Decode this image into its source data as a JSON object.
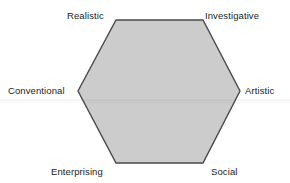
{
  "figure": {
    "shape": "hexagon",
    "background_color": "#ffffff",
    "fill_color": "#cccccc",
    "stroke_color": "#4a4a4a",
    "text_color": "#1b1b1b"
  },
  "chart_data": {
    "type": "diagram",
    "title": "",
    "shape": "hexagon",
    "vertices": [
      {
        "id": "realistic",
        "label": "Realistic",
        "position": "top-left",
        "x": 116,
        "y": 20
      },
      {
        "id": "investigative",
        "label": "Investigative",
        "position": "top-right",
        "x": 203,
        "y": 20
      },
      {
        "id": "artistic",
        "label": "Artistic",
        "position": "right",
        "x": 240,
        "y": 91
      },
      {
        "id": "social",
        "label": "Social",
        "position": "bottom-right",
        "x": 203,
        "y": 163
      },
      {
        "id": "enterprising",
        "label": "Enterprising",
        "position": "bottom-left",
        "x": 116,
        "y": 163
      },
      {
        "id": "conventional",
        "label": "Conventional",
        "position": "left",
        "x": 78,
        "y": 91
      }
    ],
    "edges": [
      [
        "realistic",
        "investigative"
      ],
      [
        "investigative",
        "artistic"
      ],
      [
        "artistic",
        "social"
      ],
      [
        "social",
        "enterprising"
      ],
      [
        "enterprising",
        "conventional"
      ],
      [
        "conventional",
        "realistic"
      ]
    ],
    "fill": "#cccccc",
    "stroke": "#4a4a4a",
    "grid": false,
    "legend": "none"
  },
  "labels": {
    "realistic": "Realistic",
    "investigative": "Investigative",
    "conventional": "Conventional",
    "artistic": "Artistic",
    "enterprising": "Enterprising",
    "social": "Social"
  }
}
